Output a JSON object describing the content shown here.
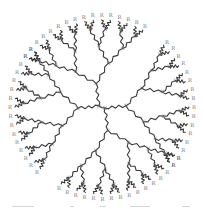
{
  "diagram": {
    "center": [
      102,
      107
    ],
    "outer_radius": 92,
    "core_label": "N",
    "branch_node_label": "N",
    "terminal_label": "R",
    "terminal_count": 64,
    "generations": 4,
    "colors": {
      "bond": "#3a3a3a",
      "label": "#777777",
      "background": "#ffffff",
      "caption": "#d6d6d6"
    }
  },
  "caption": {
    "dashes": [
      {
        "x": 12,
        "w": 22
      },
      {
        "x": 70,
        "w": 4
      },
      {
        "x": 100,
        "w": 6
      },
      {
        "x": 130,
        "w": 20
      },
      {
        "x": 182,
        "w": 8
      }
    ]
  }
}
